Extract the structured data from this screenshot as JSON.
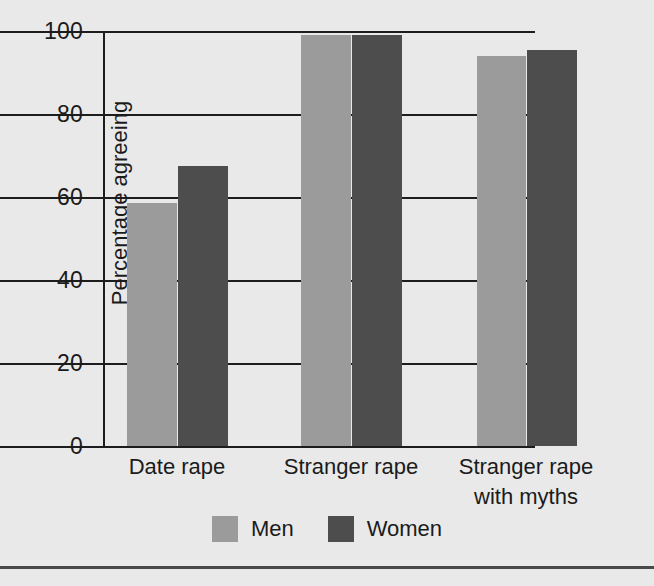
{
  "chart_data": {
    "type": "bar",
    "title": "",
    "xlabel": "",
    "ylabel": "Percentage agreeing",
    "ylim": [
      0,
      100
    ],
    "yticks": [
      0,
      20,
      40,
      60,
      80,
      100
    ],
    "ytick_labels": [
      "0",
      "20",
      "40",
      "60",
      "80",
      "100"
    ],
    "grid": true,
    "grid_axis": "y",
    "legend_position": "bottom-center",
    "categories": [
      "Date rape",
      "Stranger rape",
      "Stranger rape\nwith myths"
    ],
    "series": [
      {
        "name": "Men",
        "color": "#9b9b9b",
        "values": [
          58.5,
          99.0,
          94.0
        ]
      },
      {
        "name": "Women",
        "color": "#4d4d4d",
        "values": [
          67.5,
          99.0,
          95.5
        ]
      }
    ]
  },
  "figure": {
    "background_color": "#e9e9e9",
    "axis_color": "#1d1d1d",
    "text_color": "#1b1b1b"
  }
}
